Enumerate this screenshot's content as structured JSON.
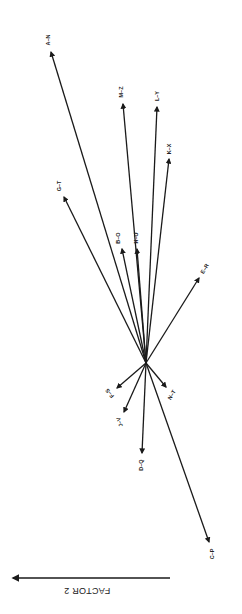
{
  "diagram": {
    "type": "factor-loading vector plot (rotated 180°/portrait)",
    "origin": {
      "x": 146,
      "y": 363
    },
    "ink_color": "#1a1a1a",
    "background": "#ffffff",
    "vectors": [
      {
        "id": "a-n",
        "label": "A–N",
        "tip": [
          51,
          52
        ],
        "label_pos": [
          49,
          40
        ],
        "label_rotate": -90
      },
      {
        "id": "m-z",
        "label": "M–Z",
        "tip": [
          123,
          104
        ],
        "label_pos": [
          122,
          92
        ],
        "label_rotate": -90
      },
      {
        "id": "l-y",
        "label": "L–Y",
        "tip": [
          157,
          107
        ],
        "label_pos": [
          158,
          96
        ],
        "label_rotate": -90
      },
      {
        "id": "k-x",
        "label": "K–X",
        "tip": [
          169,
          159
        ],
        "label_pos": [
          170,
          149
        ],
        "label_rotate": -90
      },
      {
        "id": "g-t",
        "label": "G–T",
        "tip": [
          64,
          197
        ],
        "label_pos": [
          60,
          186
        ],
        "label_rotate": -90
      },
      {
        "id": "b-o",
        "label": "B–O",
        "tip": [
          122,
          249
        ],
        "label_pos": [
          119,
          238
        ],
        "label_rotate": -90
      },
      {
        "id": "h-u",
        "label": "H–U",
        "tip": [
          137,
          249
        ],
        "label_pos": [
          137,
          238
        ],
        "label_rotate": -90
      },
      {
        "id": "e-r",
        "label": "E–R",
        "tip": [
          199,
          278
        ],
        "label_pos": [
          205,
          269
        ],
        "label_rotate": -60
      },
      {
        "id": "f-s",
        "label": "F–S",
        "tip": [
          117,
          388
        ],
        "label_pos": [
          110,
          393
        ],
        "label_rotate": -130
      },
      {
        "id": "j-v",
        "label": "J–V",
        "tip": [
          124,
          412
        ],
        "label_pos": [
          120,
          422
        ],
        "label_rotate": -110
      },
      {
        "id": "d-q",
        "label": "D–Q",
        "tip": [
          142,
          453
        ],
        "label_pos": [
          142,
          465
        ],
        "label_rotate": -90
      },
      {
        "id": "n-t",
        "label": "N–T",
        "tip": [
          166,
          387
        ],
        "label_pos": [
          172,
          395
        ],
        "label_rotate": -60
      },
      {
        "id": "c-p",
        "label": "C–P",
        "tip": [
          209,
          542
        ],
        "label_pos": [
          213,
          554
        ],
        "label_rotate": -90
      }
    ],
    "axis": {
      "label": "FACTOR 2",
      "arrow_start": [
        170,
        578
      ],
      "arrow_end": [
        13,
        578
      ],
      "label_pos": [
        87,
        590
      ]
    }
  }
}
